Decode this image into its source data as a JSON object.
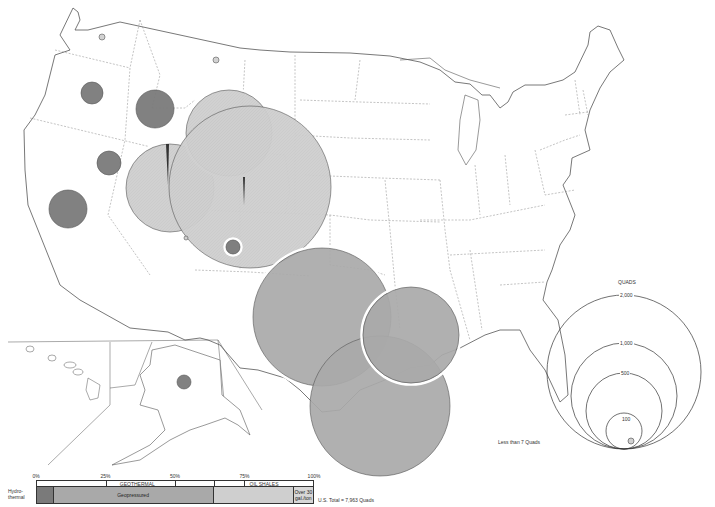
{
  "legend": {
    "title": "QUADS",
    "circles": [
      {
        "label": "2,000",
        "value": 2000
      },
      {
        "label": "1,000",
        "value": 1000
      },
      {
        "label": "500",
        "value": 500
      },
      {
        "label": "100",
        "value": 100
      }
    ],
    "small_label": "Less than 7 Quads"
  },
  "bar": {
    "scale": [
      "0%",
      "25%",
      "50%",
      "75%",
      "100%"
    ],
    "categories": [
      {
        "label": "GEOTHERMAL",
        "start": 0,
        "end": 64
      },
      {
        "label": "OIL SHALES",
        "start": 64,
        "end": 100
      }
    ],
    "segments": [
      {
        "label": "Hydro-\nthermal",
        "pct": 6,
        "color": "#7a7a7a",
        "outside_label": true
      },
      {
        "label": "Geopressured",
        "pct": 58,
        "color": "#a9a9a9"
      },
      {
        "label": "",
        "pct": 29,
        "color": "#cfcfcf"
      },
      {
        "label": "Over 30\ngal./ton",
        "pct": 7,
        "color": "#d7d7d7"
      }
    ],
    "outside_label": "Hydro-\nthermal",
    "total_label": "U.S. Total = 7,963 Quads"
  },
  "colors": {
    "hydrothermal": "#7a7a7a",
    "geopressured": "#a9a9a9",
    "oil_shale": "#cfcfcf",
    "state_line": "#888888",
    "coast": "#555555"
  },
  "map_circles": [
    {
      "name": "washington-small",
      "type": "small",
      "cx": 102,
      "cy": 37,
      "r": 3
    },
    {
      "name": "montana-small",
      "type": "small",
      "cx": 216,
      "cy": 60,
      "r": 3
    },
    {
      "name": "oregon-hydrothermal",
      "type": "hydrothermal",
      "cx": 92,
      "cy": 93,
      "r": 11
    },
    {
      "name": "idaho-hydrothermal",
      "type": "hydrothermal",
      "cx": 155,
      "cy": 109,
      "r": 19
    },
    {
      "name": "nevada-hydrothermal",
      "type": "hydrothermal",
      "cx": 109,
      "cy": 163,
      "r": 12
    },
    {
      "name": "california-hydrothermal",
      "type": "hydrothermal",
      "cx": 68,
      "cy": 209,
      "r": 19
    },
    {
      "name": "utah-oil-shale",
      "type": "oilshale",
      "cx": 170,
      "cy": 188,
      "r": 44
    },
    {
      "name": "wyoming-oil-shale",
      "type": "oilshale",
      "cx": 229,
      "cy": 133,
      "r": 43
    },
    {
      "name": "colorado-oil-shale",
      "type": "oilshale",
      "cx": 250,
      "cy": 187,
      "r": 81
    },
    {
      "name": "new-mexico-hydrothermal",
      "type": "hydrothermal-ring",
      "cx": 233,
      "cy": 247,
      "r": 7
    },
    {
      "name": "texas-geopressured-inland",
      "type": "geopressured",
      "cx": 322,
      "cy": 317,
      "r": 69
    },
    {
      "name": "texas-geopressured-offshore",
      "type": "geopressured",
      "cx": 380,
      "cy": 406,
      "r": 70
    },
    {
      "name": "louisiana-geopressured",
      "type": "geopressured",
      "cx": 411,
      "cy": 335,
      "r": 48
    },
    {
      "name": "alaska-hydrothermal",
      "type": "hydrothermal",
      "cx": 184,
      "cy": 382,
      "r": 7
    },
    {
      "name": "arizona-small",
      "type": "small",
      "cx": 186,
      "cy": 238,
      "r": 2
    }
  ]
}
